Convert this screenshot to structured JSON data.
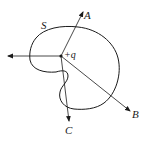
{
  "diagram": {
    "surface_label": "S",
    "charge_label": "+q",
    "arrows": [
      {
        "name": "A",
        "label": "A"
      },
      {
        "name": "B",
        "label": "B"
      },
      {
        "name": "C",
        "label": "C"
      },
      {
        "name": "left",
        "label": ""
      }
    ],
    "colors": {
      "stroke": "#1a1a1a",
      "background": "#ffffff"
    }
  }
}
